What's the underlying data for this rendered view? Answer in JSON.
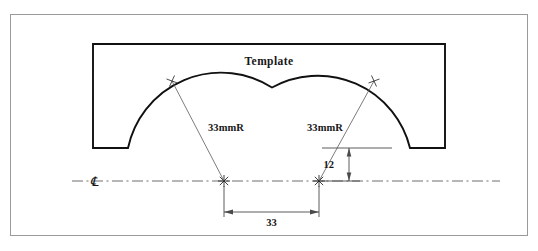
{
  "drawing": {
    "title_label": "Template",
    "radius_label_left": "33mmR",
    "radius_label_right": "33mmR",
    "dimension_horizontal": "33",
    "dimension_vertical": "12",
    "centerline_symbol": "℄"
  },
  "colors": {
    "outline": "#111111",
    "border": "#9a9a9a",
    "leader": "#5a5a5a",
    "centerline": "#6e6e6e",
    "dimension": "#4a4a4a",
    "text": "#161616",
    "background": "#ffffff"
  },
  "geometry": {
    "frame": {
      "x": 10,
      "y": 14,
      "width": 518,
      "height": 222
    },
    "body_box": {
      "x": 93,
      "y": 44,
      "width": 352,
      "height": 104
    },
    "centerline": {
      "y": 181,
      "x_start": 72,
      "x_end": 500
    },
    "arc_center_left": {
      "x": 224,
      "y": 181
    },
    "arc_center_right": {
      "x": 319,
      "y": 181
    },
    "arc_radius_px": 95,
    "tick_left": {
      "x": 172,
      "y": 81
    },
    "tick_right": {
      "x": 374,
      "y": 81
    },
    "dim_horizontal": {
      "y": 212,
      "x1": 224,
      "x2": 319
    },
    "dim_vertical": {
      "x": 349,
      "y_top": 148,
      "y_bottom": 181
    }
  }
}
